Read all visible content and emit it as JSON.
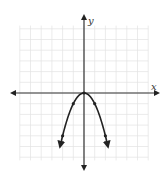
{
  "chart_data": {
    "type": "line",
    "title": "",
    "xlabel": "x",
    "ylabel": "y",
    "function": "y = -x^2",
    "xlim": [
      -6,
      6
    ],
    "ylim": [
      -6.3,
      6.3
    ],
    "grid": true,
    "legend": null,
    "series": [
      {
        "name": "y = -x^2",
        "points": [
          [
            -2,
            -4
          ],
          [
            -1,
            -1
          ],
          [
            0,
            0
          ],
          [
            1,
            -1
          ],
          [
            2,
            -4
          ]
        ],
        "arrows_at_ends": true
      }
    ],
    "tick_labels": []
  },
  "colors": {
    "grid": "#e2e2e2",
    "axis": "#333333",
    "curve": "#222222",
    "background": "#ffffff"
  },
  "labels": {
    "x_axis": "x",
    "y_axis": "y"
  }
}
